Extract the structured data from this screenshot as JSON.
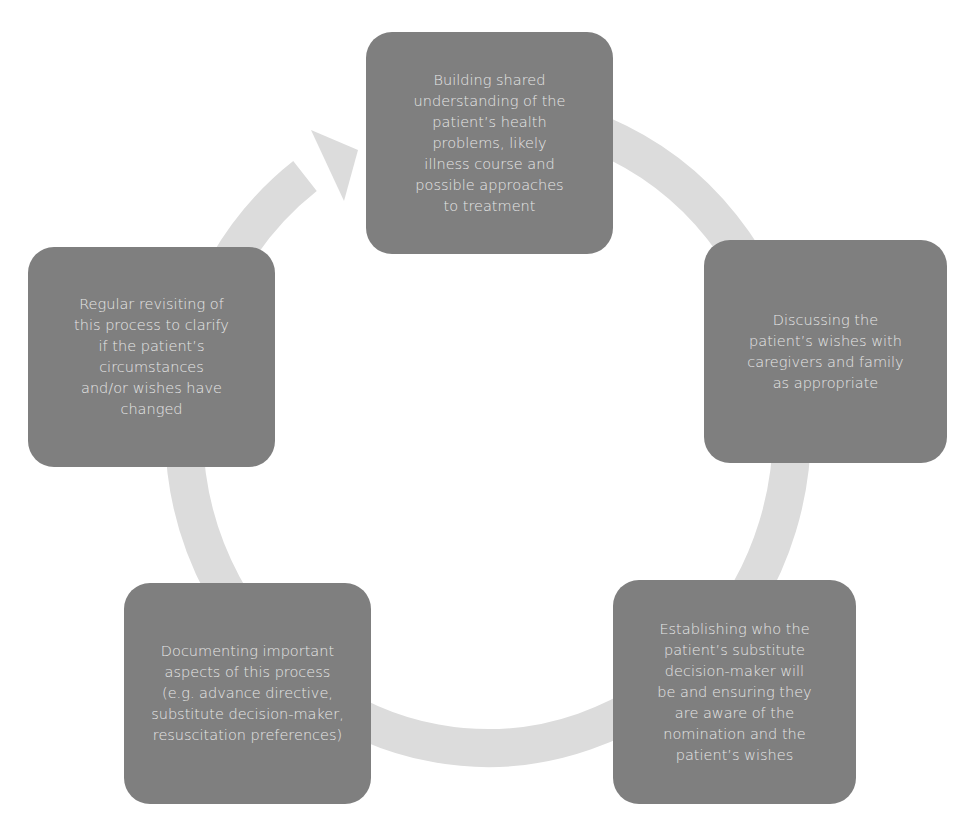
{
  "diagram": {
    "type": "cycle",
    "colors": {
      "box_fill": "#7f7f7f",
      "box_text": "#e6e6e6",
      "ring": "#dcdcdc",
      "background": "#ffffff"
    },
    "steps": [
      {
        "id": "shared-understanding",
        "position": "top",
        "text": "Building shared\nunderstanding of the\npatient’s health\nproblems, likely\nillness course and\npossible approaches\nto treatment"
      },
      {
        "id": "discuss-wishes",
        "position": "right",
        "text": "Discussing the\npatient’s wishes with\ncaregivers and family\nas appropriate"
      },
      {
        "id": "substitute-decision-maker",
        "position": "bottom-right",
        "text": "Establishing who the\npatient’s substitute\ndecision-maker will\nbe and ensuring they\nare aware of the\nnomination and the\npatient’s wishes"
      },
      {
        "id": "documenting",
        "position": "bottom-left",
        "text": "Documenting important\naspects of this process\n(e.g. advance directive,\nsubstitute decision-maker,\nresuscitation preferences)"
      },
      {
        "id": "regular-revisiting",
        "position": "left",
        "text": "Regular revisiting of\nthis process to clarify\nif the patient’s\ncircumstances\nand/or wishes have\nchanged"
      }
    ],
    "flow": "clockwise",
    "arrow": "cycle-arrow pointing into top step"
  }
}
